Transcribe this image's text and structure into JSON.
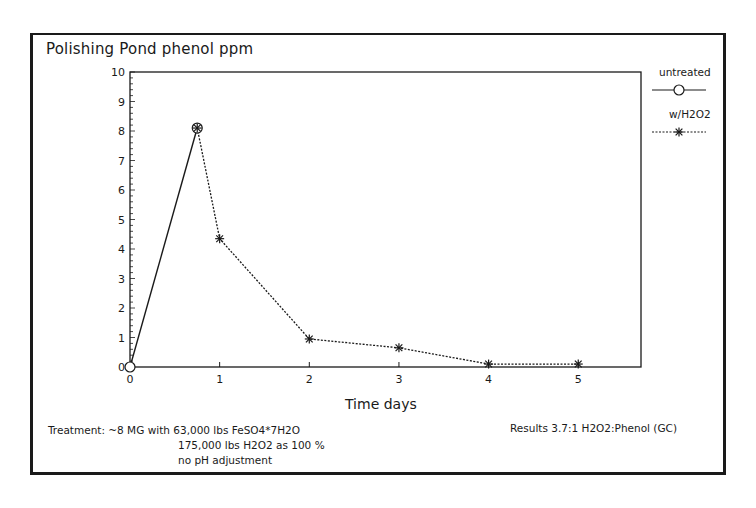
{
  "title": "Polishing Pond phenol ppm",
  "legend": {
    "untreated": "untreated",
    "treated": "w/H2O2"
  },
  "axes": {
    "xlabel": "Time days",
    "yticks": [
      "0",
      "1",
      "2",
      "3",
      "4",
      "5",
      "6",
      "7",
      "8",
      "9",
      "10"
    ],
    "xticks": [
      "0",
      "1",
      "2",
      "3",
      "4",
      "5"
    ]
  },
  "notes": {
    "treatment_line1": "Treatment: ~8 MG with 63,000 lbs FeSO4*7H2O",
    "treatment_line2": "175,000 lbs H2O2 as 100 %",
    "treatment_line3": "no pH adjustment",
    "results": "Results 3.7:1 H2O2:Phenol (GC)"
  },
  "chart_data": {
    "type": "line",
    "title": "Polishing Pond phenol ppm",
    "xlabel": "Time days",
    "ylabel": "phenol ppm",
    "xlim": [
      0,
      5.7
    ],
    "ylim": [
      0,
      10
    ],
    "grid": false,
    "legend_position": "right, outside plot",
    "series": [
      {
        "name": "untreated",
        "style": "solid line, open circle markers",
        "x": [
          0,
          0.75
        ],
        "y": [
          0,
          8.1
        ]
      },
      {
        "name": "w/H2O2",
        "style": "dotted line, asterisk markers",
        "x": [
          0.75,
          1,
          2,
          3,
          4,
          5
        ],
        "y": [
          8.1,
          4.35,
          0.95,
          0.65,
          0.1,
          0.1
        ]
      }
    ],
    "annotations": [
      "Treatment: ~8 MG with 63,000 lbs FeSO4*7H2O",
      "175,000 lbs H2O2 as 100 %",
      "no pH adjustment",
      "Results 3.7:1 H2O2:Phenol (GC)"
    ]
  }
}
